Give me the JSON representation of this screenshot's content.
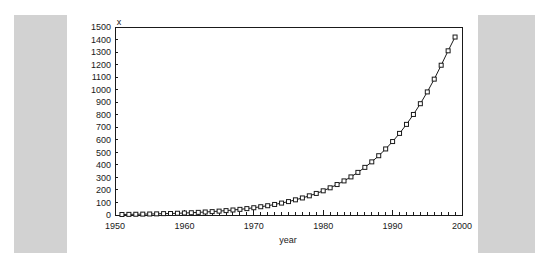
{
  "chart_data": {
    "type": "line",
    "title": "",
    "xlabel": "year",
    "ylabel": "x",
    "xlim": [
      1950,
      2000
    ],
    "ylim": [
      0,
      1500
    ],
    "ytick_step": 100,
    "xtick_step": 10,
    "xminor_step": 1,
    "grid": false,
    "legend": false,
    "marker": "open-square",
    "line_color": "#1a1a1a",
    "marker_face_color": "#ffffff",
    "xticks": [
      1950,
      1960,
      1970,
      1980,
      1990,
      2000
    ],
    "xtick_labels": [
      "1950",
      "1960",
      "1970",
      "1980",
      "1990",
      "2000"
    ],
    "yticks": [
      0,
      100,
      200,
      300,
      400,
      500,
      600,
      700,
      800,
      900,
      1000,
      1100,
      1200,
      1300,
      1400,
      1500
    ],
    "ytick_labels": [
      "0",
      "100",
      "200",
      "300",
      "400",
      "500",
      "600",
      "700",
      "800",
      "900",
      "1000",
      "1100",
      "1200",
      "1300",
      "1400",
      "1500"
    ],
    "x": [
      1951,
      1952,
      1953,
      1954,
      1955,
      1956,
      1957,
      1958,
      1959,
      1960,
      1961,
      1962,
      1963,
      1964,
      1965,
      1966,
      1967,
      1968,
      1969,
      1970,
      1971,
      1972,
      1973,
      1974,
      1975,
      1976,
      1977,
      1978,
      1979,
      1980,
      1981,
      1982,
      1983,
      1984,
      1985,
      1986,
      1987,
      1988,
      1989,
      1990,
      1991,
      1992,
      1993,
      1994,
      1995,
      1996,
      1997,
      1998,
      1999
    ],
    "values": [
      4,
      5,
      6,
      7,
      8,
      9,
      11,
      12,
      14,
      16,
      18,
      21,
      24,
      27,
      31,
      35,
      40,
      45,
      51,
      58,
      66,
      74,
      84,
      95,
      107,
      121,
      136,
      153,
      172,
      193,
      217,
      243,
      272,
      304,
      340,
      380,
      424,
      473,
      527,
      586,
      651,
      723,
      802,
      888,
      982,
      1084,
      1195,
      1310,
      1420
    ],
    "series": [
      {
        "name": "x",
        "values": [
          4,
          5,
          6,
          7,
          8,
          9,
          11,
          12,
          14,
          16,
          18,
          21,
          24,
          27,
          31,
          35,
          40,
          45,
          51,
          58,
          66,
          74,
          84,
          95,
          107,
          121,
          136,
          153,
          172,
          193,
          217,
          243,
          272,
          304,
          340,
          380,
          424,
          473,
          527,
          586,
          651,
          723,
          802,
          888,
          982,
          1084,
          1195,
          1310,
          1420
        ]
      }
    ]
  }
}
